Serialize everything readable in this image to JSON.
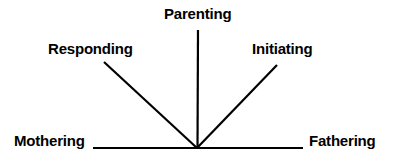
{
  "diagram": {
    "type": "radial-axis-diagram",
    "canvas": {
      "width": 395,
      "height": 163,
      "background": "#ffffff"
    },
    "stroke_color": "#000000",
    "text_color": "#000000",
    "vertex": {
      "x": 197,
      "y": 148
    },
    "labels": {
      "mothering": "Mothering",
      "responding": "Responding",
      "parenting": "Parenting",
      "initiating": "Initiating",
      "fathering": "Fathering"
    },
    "rays": [
      {
        "name": "mothering-axis",
        "label": "Mothering",
        "from": {
          "x": 93,
          "y": 148
        },
        "to": {
          "x": 197,
          "y": 148
        },
        "orientation": "horizontal-left"
      },
      {
        "name": "responding-axis",
        "label": "Responding",
        "from": {
          "x": 104,
          "y": 62
        },
        "to": {
          "x": 197,
          "y": 148
        },
        "orientation": "diagonal-upper-left"
      },
      {
        "name": "parenting-axis",
        "label": "Parenting",
        "from": {
          "x": 198,
          "y": 30
        },
        "to": {
          "x": 197,
          "y": 148
        },
        "orientation": "vertical"
      },
      {
        "name": "initiating-axis",
        "label": "Initiating",
        "from": {
          "x": 277,
          "y": 65
        },
        "to": {
          "x": 197,
          "y": 148
        },
        "orientation": "diagonal-upper-right"
      },
      {
        "name": "fathering-axis",
        "label": "Fathering",
        "from": {
          "x": 197,
          "y": 148
        },
        "to": {
          "x": 303,
          "y": 148
        },
        "orientation": "horizontal-right"
      }
    ]
  }
}
